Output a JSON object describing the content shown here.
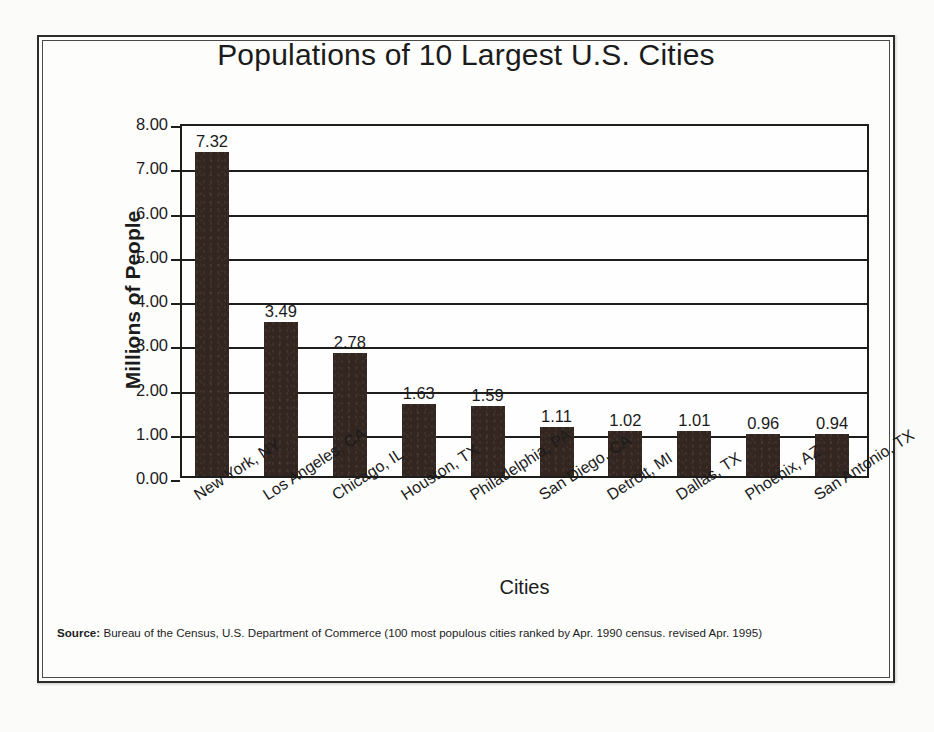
{
  "chart_data": {
    "type": "bar",
    "title": "Populations of 10 Largest U.S. Cities",
    "xlabel": "Cities",
    "ylabel": "Millions of People",
    "ylim": [
      0,
      8
    ],
    "ytick_step": 1,
    "ytick_labels": [
      "0.00",
      "1.00",
      "2.00",
      "3.00",
      "4.00",
      "5.00",
      "6.00",
      "7.00",
      "8.00"
    ],
    "grid": true,
    "legend": "none",
    "bar_color": "#332620",
    "categories": [
      "New York, NY",
      "Los Angeles, CA",
      "Chicago, IL",
      "Houston, TX",
      "Philadelphia, PA",
      "San Diego, CA",
      "Detroit, MI",
      "Dallas, TX",
      "Phoenix, AZ",
      "San Antonio, TX"
    ],
    "values": [
      7.32,
      3.49,
      2.78,
      1.63,
      1.59,
      1.11,
      1.02,
      1.01,
      0.96,
      0.94
    ],
    "value_labels": [
      "7.32",
      "3.49",
      "2.78",
      "1.63",
      "1.59",
      "1.11",
      "1.02",
      "1.01",
      "0.96",
      "0.94"
    ]
  },
  "source": {
    "label": "Source:",
    "text": "Bureau of the Census, U.S. Department of Commerce (100 most populous cities ranked by Apr. 1990 census. revised Apr. 1995)"
  }
}
